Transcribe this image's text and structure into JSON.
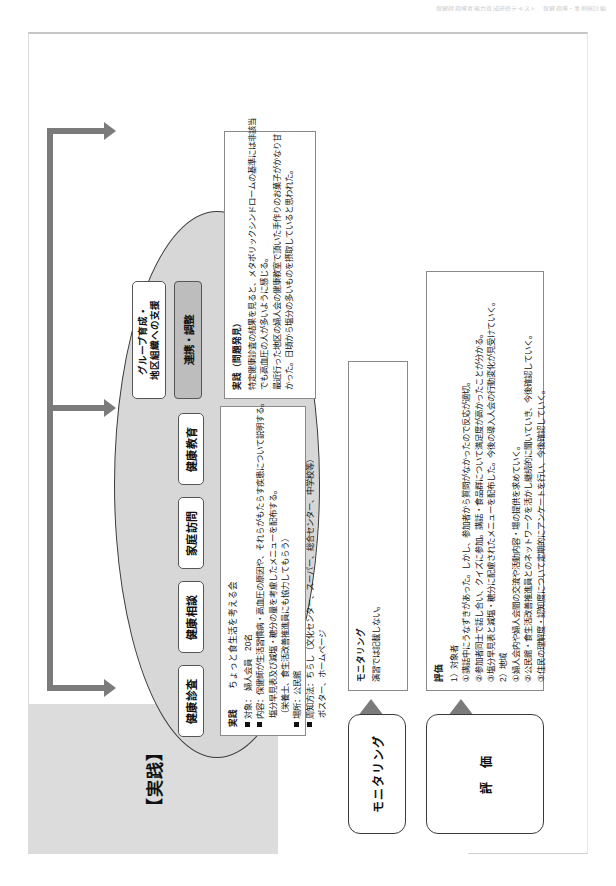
{
  "scan_header": "保健師指導者能力育成研修テキスト　保健指導・事例検討編",
  "bands": {
    "practice": "【実践】",
    "evaluation": "【評価】"
  },
  "ellipse": {
    "methods": [
      {
        "id": "kenkou-shinsa",
        "label": "健康診査"
      },
      {
        "id": "kenkou-soudan",
        "label": "健康相談"
      },
      {
        "id": "katei-houmon",
        "label": "家庭訪問"
      },
      {
        "id": "kenkou-kyouiku",
        "label": "健康教育"
      }
    ],
    "group_support": "グループ育成・\n地区組織への支援",
    "group_support_line1": "グループ育成・",
    "group_support_line2": "地区組織への支援",
    "coordination": "連携・調整"
  },
  "practice_detail": {
    "heading": "実践",
    "lines": [
      "■対象：　婦人会員　20名",
      "■内容：保健師が生活習慣病・高血圧の原因や、それらがもたらす疾患について説明する。",
      "　　　　塩分早見表及び減塩・糖分の量を考慮したメニューを配布する。",
      "　　　　（栄養士、衛生活改善推進員にも協力してもらう）",
      "■場所：公民館",
      "■周知方法：ちらし（文化センター、スーパー、総合センター、中学校等）",
      "　　　　　　ポスター、ホームページ"
    ],
    "line_items": [
      {
        "mark": true,
        "text": "対象：　婦人会員　20名"
      },
      {
        "mark": true,
        "text": "内容：保健師が生活習慣病・高血圧の原因や、それらがもたらす疾患について説明する。"
      },
      {
        "mark": false,
        "text": "塩分早見表及び減塩・糖分の量を考慮したメニューを配布する。"
      },
      {
        "mark": false,
        "text": "（栄養士、食生活改善推進員にも協力してもらう）"
      },
      {
        "mark": true,
        "text": "場所：公民館"
      },
      {
        "mark": true,
        "text": "周知方法：ちらし（文化センター、スーパー、総合センター、中学校等）"
      },
      {
        "mark": false,
        "text": "ポスター、ホームページ"
      }
    ],
    "subtitle_right": "ちょっと食生活を考える会"
  },
  "problem_discovery": {
    "heading": "実践（問題発見）",
    "lines": [
      "特定健康診査の結果を見ると、メタボリックシンドロームの基準には非該当",
      "でも高血圧の人が多いように感じる。",
      "最近行った地区の婦人会の健康教室で頂いた手作りのお菓子がかなり甘",
      "かった。日頃から塩分の多いものを摂取していると思われた。"
    ]
  },
  "monitoring": {
    "chip_label": "モニタリング",
    "heading": "モニタリング",
    "body": "演習では記載しない。"
  },
  "evaluation": {
    "chip_label": "評　価",
    "heading": "評価",
    "groups": [
      {
        "title": "1）対象者",
        "items": [
          "①講話中にうなずきがあった。しかし、参加者から質問がなかったので反応が適切。",
          "②参加者同士で話し合い、クイズに参加。講話・食品群について満足度が高かったことが分かる。",
          "③塩分早見表と減塩・糖分に配慮されたメニューを配布した。今後の導入人会の行動変化が見受けていく。"
        ]
      },
      {
        "title": "2）地域",
        "items": [
          "①婦人会内や婦人会間の交流や活動内容・場の提供を求めていく。",
          "②公民館・食生活改善推進員とのネットワークを活かし継続的に聞いていき、今後確認していく。",
          "③住民の理解度・認知度について定期的にアンケートを行い、今後確認していく。"
        ]
      }
    ]
  }
}
